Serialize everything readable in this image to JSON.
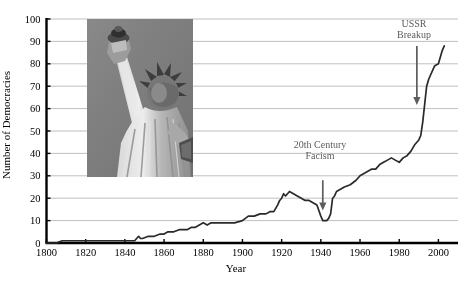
{
  "chart_data": {
    "type": "line",
    "title": "",
    "xlabel": "Year",
    "ylabel": "Number of Democracies",
    "xlim": [
      1800,
      2010
    ],
    "ylim": [
      0,
      100
    ],
    "xticks": [
      1800,
      1820,
      1840,
      1860,
      1880,
      1900,
      1920,
      1940,
      1960,
      1980,
      2000
    ],
    "yticks": [
      0,
      10,
      20,
      30,
      40,
      50,
      60,
      70,
      80,
      90,
      100
    ],
    "grid": "horizontal",
    "legend": "none",
    "line_color": "#2a2a2a",
    "grid_color": "#b8b8b8",
    "annotation_color": "#5d5d5d",
    "series": [
      {
        "name": "Number of Democracies",
        "x": [
          1800,
          1805,
          1808,
          1812,
          1820,
          1830,
          1840,
          1845,
          1847,
          1848,
          1849,
          1852,
          1855,
          1858,
          1860,
          1862,
          1865,
          1868,
          1870,
          1872,
          1874,
          1876,
          1878,
          1880,
          1882,
          1884,
          1886,
          1888,
          1890,
          1893,
          1896,
          1900,
          1903,
          1906,
          1909,
          1912,
          1914,
          1916,
          1918,
          1919,
          1920,
          1921,
          1922,
          1924,
          1926,
          1928,
          1930,
          1932,
          1934,
          1936,
          1938,
          1940,
          1941,
          1942,
          1943,
          1944,
          1945,
          1946,
          1947,
          1948,
          1950,
          1952,
          1955,
          1958,
          1960,
          1962,
          1964,
          1966,
          1968,
          1970,
          1972,
          1974,
          1976,
          1978,
          1980,
          1982,
          1984,
          1986,
          1988,
          1989,
          1990,
          1991,
          1992,
          1993,
          1994,
          1995,
          1996,
          1998,
          2000,
          2002,
          2003
        ],
        "y": [
          0,
          0,
          1,
          1,
          1,
          1,
          1,
          1,
          3,
          2,
          2,
          3,
          3,
          4,
          4,
          5,
          5,
          6,
          6,
          6,
          7,
          7,
          8,
          9,
          8,
          9,
          9,
          9,
          9,
          9,
          9,
          10,
          12,
          12,
          13,
          13,
          14,
          14,
          17,
          19,
          20,
          22,
          21,
          23,
          22,
          21,
          20,
          19,
          19,
          18,
          17,
          12,
          10,
          10,
          10,
          11,
          13,
          20,
          21,
          23,
          24,
          25,
          26,
          28,
          30,
          31,
          32,
          33,
          33,
          35,
          36,
          37,
          38,
          37,
          36,
          38,
          39,
          41,
          44,
          45,
          46,
          48,
          54,
          62,
          70,
          73,
          75,
          79,
          80,
          86,
          88
        ],
        "note": "Values estimated from gridlines; 0-100 scale"
      }
    ],
    "annotations": [
      {
        "id": "fascism",
        "text_line1": "20th Century",
        "text_line2": "Facism",
        "arrow_year": 1941,
        "arrow_from_value": 28,
        "arrow_to_value": 15
      },
      {
        "id": "ussr",
        "text_line1": "USSR",
        "text_line2": "Breakup",
        "arrow_year": 1989,
        "arrow_from_value": 88,
        "arrow_to_value": 62
      }
    ],
    "inset_image": {
      "name": "statue-of-liberty-photo",
      "alt": "Statue of Liberty"
    }
  }
}
